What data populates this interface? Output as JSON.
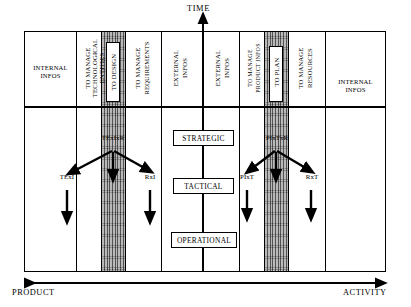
{
  "diagram": {
    "axes": {
      "time_label": "TIME",
      "left_label": "PRODUCT",
      "right_label": "ACTIVITY"
    },
    "columns": [
      {
        "id": "internal-infos-left",
        "label": "INTERNAL\nINFOS",
        "orientation": "horizontal",
        "shaded": false
      },
      {
        "id": "to-manage-tech-entities",
        "label": "TO MANAGE\nTECHNOLOGICAL ENTITIES",
        "orientation": "vertical",
        "shaded": false
      },
      {
        "id": "to-design",
        "label": "TO DESIGN",
        "orientation": "vertical",
        "shaded": true
      },
      {
        "id": "to-manage-requirements",
        "label": "TO MANAGE\nREQUIREMENTS",
        "orientation": "vertical",
        "shaded": false
      },
      {
        "id": "external-infos-left",
        "label": "EXTERNAL\nINFOS",
        "orientation": "vertical",
        "shaded": false
      },
      {
        "id": "external-infos-right",
        "label": "EXTERNAL\nINFOS",
        "orientation": "vertical",
        "shaded": false
      },
      {
        "id": "to-manage-product-infos",
        "label": "TO MANAGE\nPRODUCT INFOS",
        "orientation": "vertical",
        "shaded": false
      },
      {
        "id": "to-plan",
        "label": "TO PLAN",
        "orientation": "vertical",
        "shaded": true
      },
      {
        "id": "to-manage-resources",
        "label": "TO MANAGE\nRESOURCES",
        "orientation": "vertical",
        "shaded": false
      },
      {
        "id": "internal-infos-right",
        "label": "INTERNAL\nINFOS",
        "orientation": "horizontal",
        "shaded": false
      }
    ],
    "column_labels": {
      "internal_infos_left_line1": "INTERNAL",
      "internal_infos_left_line2": "INFOS",
      "internal_infos_right_line1": "INTERNAL",
      "internal_infos_right_line2": "INFOS",
      "to_manage_tech_line1": "TO MANAGE",
      "to_manage_tech_line2": "TECHNOLOGICAL",
      "to_manage_tech_line3": "ENTITIES",
      "to_design": "TO DESIGN",
      "to_manage_req_line1": "TO MANAGE",
      "to_manage_req_line2": "REQUIREMENTS",
      "external_infos_left_line1": "EXTERNAL",
      "external_infos_left_line2": "INFOS",
      "external_infos_right_line1": "EXTERNAL",
      "external_infos_right_line2": "INFOS",
      "to_manage_product_line1": "TO MANAGE",
      "to_manage_product_line2": "PRODUCT INFOS",
      "to_plan": "TO PLAN",
      "to_manage_res_line1": "TO MANAGE",
      "to_manage_res_line2": "RESOURCES"
    },
    "levels": [
      {
        "id": "strategic",
        "label": "STRATEGIC"
      },
      {
        "id": "tactical",
        "label": "TACTICAL"
      },
      {
        "id": "operational",
        "label": "OPERATIONAL"
      }
    ],
    "flows": {
      "design_source": "TExIxR",
      "design_left": "TExI",
      "design_right": "RxI",
      "plan_source": "PIxTxR",
      "plan_left": "PIxT",
      "plan_right": "RxT"
    },
    "colors": {
      "stroke": "#000000",
      "background": "#ffffff",
      "hatch_fill": "#b9b9b9"
    }
  }
}
